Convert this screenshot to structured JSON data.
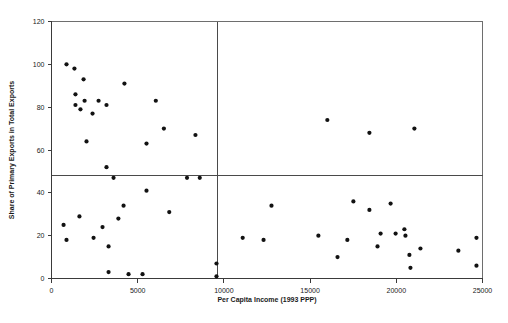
{
  "chart_data": {
    "type": "scatter",
    "title": "",
    "xlabel": "Per Capita Income (1993 PPP)",
    "ylabel": "Share of Primary Exports in Total Exports",
    "xlim": [
      0,
      25000
    ],
    "ylim": [
      0,
      120
    ],
    "xticks": [
      0,
      5000,
      10000,
      15000,
      20000,
      25000
    ],
    "xtick_labels": [
      "0",
      "5000",
      "10000",
      "15000",
      "20000",
      "25000"
    ],
    "yticks": [
      0,
      20,
      40,
      60,
      80,
      100,
      120
    ],
    "ytick_labels": [
      "0",
      "20",
      "40",
      "60",
      "80",
      "100",
      "120"
    ],
    "grid": false,
    "legend": null,
    "reference_lines": [
      {
        "orientation": "horizontal",
        "value": 48,
        "name": "median-share-line"
      },
      {
        "orientation": "vertical",
        "value": 9600,
        "name": "median-income-line"
      }
    ],
    "marker": {
      "shape": "circle",
      "size": 2.1,
      "color": "#121212"
    },
    "points": [
      {
        "x": 870,
        "y": 100
      },
      {
        "x": 1330,
        "y": 98
      },
      {
        "x": 1860,
        "y": 93
      },
      {
        "x": 4230,
        "y": 91
      },
      {
        "x": 1390,
        "y": 86
      },
      {
        "x": 1920,
        "y": 83
      },
      {
        "x": 2730,
        "y": 83
      },
      {
        "x": 6050,
        "y": 83
      },
      {
        "x": 1390,
        "y": 81
      },
      {
        "x": 3190,
        "y": 81
      },
      {
        "x": 1680,
        "y": 79
      },
      {
        "x": 2380,
        "y": 77
      },
      {
        "x": 6520,
        "y": 70
      },
      {
        "x": 8350,
        "y": 67
      },
      {
        "x": 2030,
        "y": 64
      },
      {
        "x": 5510,
        "y": 63
      },
      {
        "x": 3190,
        "y": 52
      },
      {
        "x": 7860,
        "y": 47
      },
      {
        "x": 8600,
        "y": 47
      },
      {
        "x": 3600,
        "y": 47
      },
      {
        "x": 5510,
        "y": 41
      },
      {
        "x": 12760,
        "y": 34
      },
      {
        "x": 17510,
        "y": 36
      },
      {
        "x": 19670,
        "y": 35
      },
      {
        "x": 4180,
        "y": 34
      },
      {
        "x": 18440,
        "y": 32
      },
      {
        "x": 6830,
        "y": 31
      },
      {
        "x": 1620,
        "y": 29
      },
      {
        "x": 16000,
        "y": 74
      },
      {
        "x": 18440,
        "y": 68
      },
      {
        "x": 21050,
        "y": 70
      },
      {
        "x": 3880,
        "y": 28
      },
      {
        "x": 2960,
        "y": 24
      },
      {
        "x": 700,
        "y": 25
      },
      {
        "x": 20470,
        "y": 23
      },
      {
        "x": 20530,
        "y": 20
      },
      {
        "x": 11090,
        "y": 19
      },
      {
        "x": 15480,
        "y": 20
      },
      {
        "x": 19090,
        "y": 21
      },
      {
        "x": 19960,
        "y": 21
      },
      {
        "x": 2440,
        "y": 19
      },
      {
        "x": 17160,
        "y": 18
      },
      {
        "x": 12300,
        "y": 18
      },
      {
        "x": 24650,
        "y": 19
      },
      {
        "x": 870,
        "y": 18
      },
      {
        "x": 3310,
        "y": 15
      },
      {
        "x": 18910,
        "y": 15
      },
      {
        "x": 21400,
        "y": 14
      },
      {
        "x": 23600,
        "y": 13
      },
      {
        "x": 20760,
        "y": 11
      },
      {
        "x": 16590,
        "y": 10
      },
      {
        "x": 9570,
        "y": 7
      },
      {
        "x": 20820,
        "y": 5
      },
      {
        "x": 24650,
        "y": 6
      },
      {
        "x": 3310,
        "y": 3
      },
      {
        "x": 4470,
        "y": 2
      },
      {
        "x": 5280,
        "y": 2
      },
      {
        "x": 9570,
        "y": 1
      }
    ]
  }
}
